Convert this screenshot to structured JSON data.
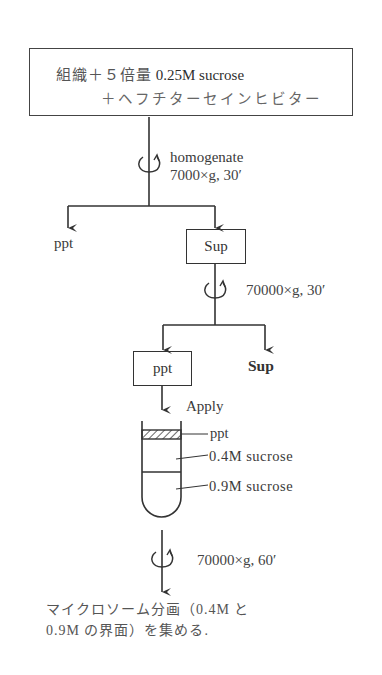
{
  "start_box": {
    "line1_jp": "組織＋５倍量",
    "line1_lat": " 0.25M sucrose",
    "line2": "＋ヘフチターセインヒビター"
  },
  "step1": {
    "action": "homogenate",
    "condition": "7000×g, 30′",
    "left_output": "ppt",
    "right_output": "Sup"
  },
  "step2": {
    "condition": "70000×g, 30′",
    "left_output": "ppt",
    "right_output": "Sup"
  },
  "apply": {
    "label": "Apply"
  },
  "tube": {
    "layers": [
      {
        "name": "ppt",
        "style": "hatched"
      },
      {
        "name": "0.4M sucrose"
      },
      {
        "name": "0.9M sucrose"
      }
    ]
  },
  "step3": {
    "condition": "70000×g, 60′"
  },
  "result": {
    "line1": "マイクロソーム分画（0.4M と",
    "line2": "0.9M の界面）を集める."
  },
  "colors": {
    "line": "#333333",
    "text": "#3a3a3a",
    "background": "#ffffff"
  }
}
